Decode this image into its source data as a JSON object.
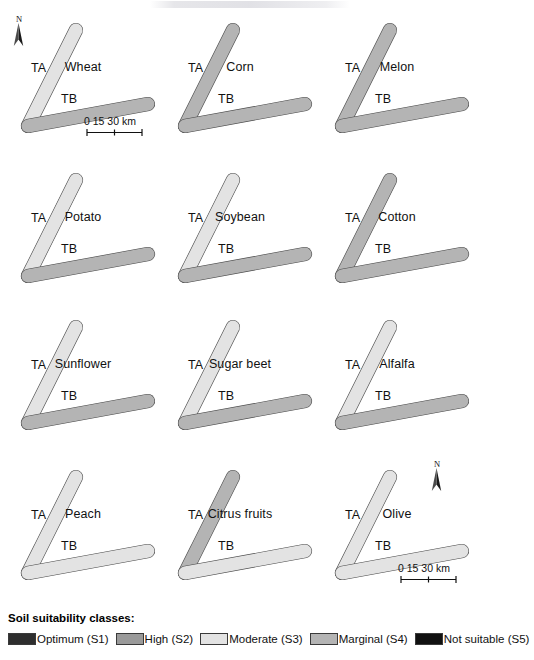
{
  "figure": {
    "title_strip": "",
    "background": "#ffffff"
  },
  "legend": {
    "title": "Soil suitability classes:",
    "items": [
      {
        "label": "Optimum (S1)",
        "color": "#2e2e2e",
        "code": "S1"
      },
      {
        "label": "High (S2)",
        "color": "#9a9a9a",
        "code": "S2"
      },
      {
        "label": "Moderate (S3)",
        "color": "#e3e3e3",
        "code": "S3"
      },
      {
        "label": "Marginal (S4)",
        "color": "#b4b4b4",
        "code": "S4"
      },
      {
        "label": "Not suitable (S5)",
        "color": "#111111",
        "code": "S5"
      }
    ]
  },
  "region_labels": {
    "ta": "TA",
    "tb": "TB"
  },
  "scalebar": {
    "ticks": [
      "0",
      "15",
      "30"
    ],
    "unit": "km",
    "text": "0   15   30 km"
  },
  "north_arrow": {
    "letter": "N",
    "icon": "north-arrow-icon"
  },
  "maps": [
    {
      "crop": "Wheat",
      "row": 0,
      "col": 0,
      "has_scalebar": true,
      "has_north": true
    },
    {
      "crop": "Corn",
      "row": 0,
      "col": 1,
      "has_scalebar": false,
      "has_north": false
    },
    {
      "crop": "Melon",
      "row": 0,
      "col": 2,
      "has_scalebar": false,
      "has_north": false
    },
    {
      "crop": "Potato",
      "row": 1,
      "col": 0,
      "has_scalebar": false,
      "has_north": false
    },
    {
      "crop": "Soybean",
      "row": 1,
      "col": 1,
      "has_scalebar": false,
      "has_north": false
    },
    {
      "crop": "Cotton",
      "row": 1,
      "col": 2,
      "has_scalebar": false,
      "has_north": false
    },
    {
      "crop": "Sunflower",
      "row": 2,
      "col": 0,
      "has_scalebar": false,
      "has_north": false
    },
    {
      "crop": "Sugar beet",
      "row": 2,
      "col": 1,
      "has_scalebar": false,
      "has_north": false
    },
    {
      "crop": "Alfalfa",
      "row": 2,
      "col": 2,
      "has_scalebar": false,
      "has_north": false
    },
    {
      "crop": "Peach",
      "row": 3,
      "col": 0,
      "has_scalebar": false,
      "has_north": false
    },
    {
      "crop": "Citrus fruits",
      "row": 3,
      "col": 1,
      "has_scalebar": false,
      "has_north": false
    },
    {
      "crop": "Olive",
      "row": 3,
      "col": 2,
      "has_scalebar": true,
      "has_north": true
    }
  ],
  "chart_data": {
    "type": "map",
    "classes": [
      "Optimum (S1)",
      "High (S2)",
      "Moderate (S3)",
      "Marginal (S4)",
      "Not suitable (S5)"
    ],
    "class_colors": [
      "#2e2e2e",
      "#9a9a9a",
      "#e3e3e3",
      "#b4b4b4",
      "#111111"
    ],
    "panels": [
      {
        "crop": "Wheat",
        "TA_dominant": "Moderate (S3)",
        "TB_dominant": "Marginal (S4)",
        "TB_notable": "Optimum (S1) patch"
      },
      {
        "crop": "Corn",
        "TA_dominant": "Marginal (S4)",
        "TB_dominant": "Marginal (S4)",
        "TB_notable": "Optimum (S1) patch"
      },
      {
        "crop": "Melon",
        "TA_dominant": "Marginal (S4)",
        "TB_dominant": "Marginal (S4)",
        "TB_notable": "High (S2) patches"
      },
      {
        "crop": "Potato",
        "TA_dominant": "Moderate (S3)",
        "TB_dominant": "Marginal (S4)",
        "TB_notable": "Optimum (S1) patch"
      },
      {
        "crop": "Soybean",
        "TA_dominant": "Moderate (S3)",
        "TB_dominant": "Marginal (S4)",
        "TB_notable": "Optimum (S1) patch"
      },
      {
        "crop": "Cotton",
        "TA_dominant": "Marginal (S4)",
        "TB_dominant": "Marginal (S4)",
        "TB_notable": "Moderate (S3) patches"
      },
      {
        "crop": "Sunflower",
        "TA_dominant": "Moderate (S3)",
        "TB_dominant": "Marginal (S4)",
        "TB_notable": "Not suitable (S5) zone"
      },
      {
        "crop": "Sugar beet",
        "TA_dominant": "Moderate (S3)",
        "TB_dominant": "Marginal (S4)",
        "TB_notable": "Not suitable (S5) tip"
      },
      {
        "crop": "Alfalfa",
        "TA_dominant": "Moderate (S3)",
        "TB_dominant": "Marginal (S4)",
        "TB_notable": "Optimum (S1) patch"
      },
      {
        "crop": "Peach",
        "TA_dominant": "Moderate (S3)",
        "TB_dominant": "Moderate (S3)",
        "TB_notable": "Marginal (S4) patches"
      },
      {
        "crop": "Citrus fruits",
        "TA_dominant": "Marginal (S4)",
        "TB_dominant": "Moderate (S3)",
        "TB_notable": "Marginal (S4) patches"
      },
      {
        "crop": "Olive",
        "TA_dominant": "Moderate (S3)",
        "TB_dominant": "Moderate (S3)",
        "TB_notable": "Marginal (S4) patch"
      }
    ],
    "scale": {
      "ticks_km": [
        0,
        15,
        30
      ],
      "unit": "km"
    },
    "legend_position": "bottom"
  }
}
